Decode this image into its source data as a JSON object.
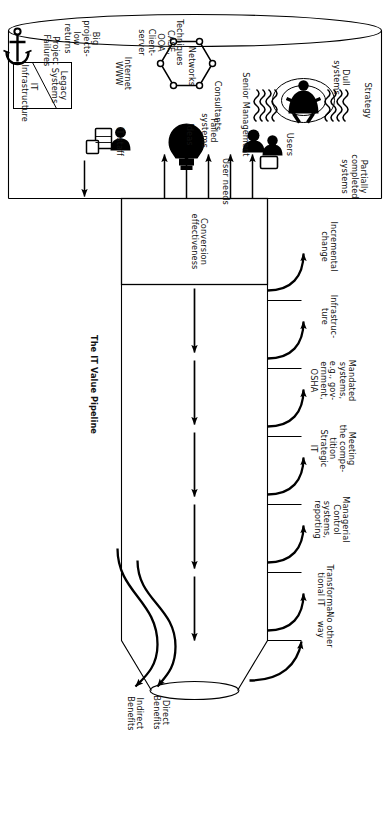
{
  "diagram": {
    "title": "The IT Value Pipeline",
    "type": "process-funnel-diagram",
    "orientation": "rotated-90-clockwise",
    "line_color": "#000000",
    "fill_color": "#ffffff",
    "mouth": {
      "legend_box": {
        "upper_label": "Legacy\nSystems",
        "lower_label": "IT\nInfrastructure"
      },
      "anchor_label": "Project\nFailures",
      "inputs": [
        {
          "label": "Strategy",
          "icon": "none"
        },
        {
          "label": "Dull\nsystems",
          "icon": "none"
        },
        {
          "label": "Senior Management",
          "icon": "executive-figure-icon"
        },
        {
          "label": "Consultants",
          "icon": "none"
        },
        {
          "label": "Partially\ncompleted\nsystems",
          "icon": "none"
        },
        {
          "label": "User needs",
          "icon": "none"
        },
        {
          "label": "Users",
          "icon": "users-icon"
        },
        {
          "label": "Ideas",
          "icon": "lightbulb-icon"
        },
        {
          "label": "IT staff",
          "icon": "it-staff-icon"
        },
        {
          "label": "Networks",
          "icon": "network-hexagon-icon"
        },
        {
          "label": "Internet\nWWW",
          "icon": "none"
        },
        {
          "label": "Techniques\nCASE,\nOOA\nClient-\nserver",
          "icon": "none"
        },
        {
          "label": "Big\nprojects-\nlow\nreturns",
          "icon": "none"
        }
      ]
    },
    "conversion_box": {
      "label": "Conversion\neffectiveness",
      "reject_label": "Failed\nsystems",
      "reject_arrow_count": 5
    },
    "outcomes": [
      {
        "label": "Incremental\nchange"
      },
      {
        "label": "Infrastruc-\nture"
      },
      {
        "label": "Mandated\nsystems,\ne.g., gov-\nernment,\nOSHA"
      },
      {
        "label": "Meeting\nthe compe-\ntition\nStrategic\nIT"
      },
      {
        "label": "Managerial\nControl\nsystems,\nreporting"
      },
      {
        "label": "Transforma-\ntional IT"
      },
      {
        "label": "No other\nway"
      }
    ],
    "outputs": [
      {
        "label": "Direct\nBenefits"
      },
      {
        "label": "Indirect\nBenefits"
      }
    ]
  }
}
